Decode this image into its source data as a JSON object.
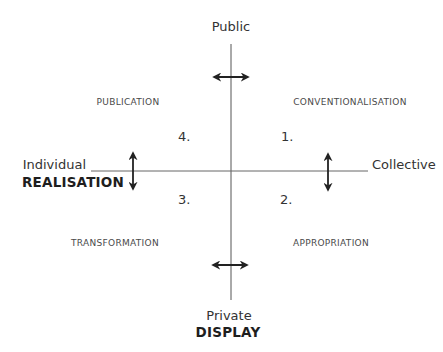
{
  "diagram": {
    "axes": {
      "vertical": {
        "top_label": "Public",
        "bottom_label": "Private",
        "bottom_title": "DISPLAY"
      },
      "horizontal": {
        "left_label": "Individual",
        "left_title": "REALISATION",
        "right_label": "Collective"
      }
    },
    "quadrants": [
      {
        "number": "1.",
        "label": "CONVENTIONALISATION",
        "position": "top-right"
      },
      {
        "number": "2.",
        "label": "APPROPRIATION",
        "position": "bottom-right"
      },
      {
        "number": "3.",
        "label": "TRANSFORMATION",
        "position": "bottom-left"
      },
      {
        "number": "4.",
        "label": "PUBLICATION",
        "position": "top-left"
      }
    ],
    "arrows": [
      {
        "name": "top-horizontal-double-arrow",
        "orientation": "horizontal"
      },
      {
        "name": "bottom-horizontal-double-arrow",
        "orientation": "horizontal"
      },
      {
        "name": "left-vertical-double-arrow",
        "orientation": "vertical"
      },
      {
        "name": "right-vertical-double-arrow",
        "orientation": "vertical"
      }
    ],
    "colors": {
      "line": "#555555",
      "arrow": "#222222",
      "text": "#2a2a2a"
    }
  }
}
